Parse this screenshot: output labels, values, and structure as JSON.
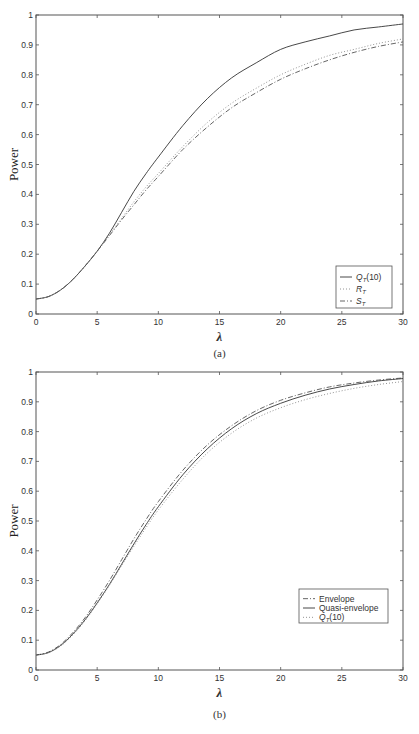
{
  "chart_data": [
    {
      "id": "a",
      "type": "line",
      "caption": "(a)",
      "xlabel": "λ",
      "ylabel": "Power",
      "xlim": [
        0,
        30
      ],
      "ylim": [
        0,
        1
      ],
      "xticks": [
        0,
        5,
        10,
        15,
        20,
        25,
        30
      ],
      "yticks": [
        0,
        0.1,
        0.2,
        0.3,
        0.4,
        0.5,
        0.6,
        0.7,
        0.8,
        0.9,
        1
      ],
      "grid": false,
      "legend_position": "lower right",
      "x": [
        0,
        1,
        2,
        3,
        4,
        5,
        6,
        7,
        8,
        9,
        10,
        12,
        14,
        16,
        18,
        20,
        22,
        24,
        26,
        28,
        30
      ],
      "series": [
        {
          "name": "Q_T(10)",
          "label_main": "Q",
          "label_sub": "T",
          "label_suffix": "(10)",
          "style": "solid",
          "values": [
            0.05,
            0.058,
            0.08,
            0.115,
            0.16,
            0.21,
            0.27,
            0.34,
            0.41,
            0.47,
            0.525,
            0.63,
            0.72,
            0.79,
            0.84,
            0.885,
            0.91,
            0.93,
            0.95,
            0.96,
            0.97
          ]
        },
        {
          "name": "R_T",
          "label_main": "R",
          "label_sub": "T",
          "label_suffix": "",
          "style": "dotted",
          "values": [
            0.05,
            0.058,
            0.08,
            0.115,
            0.16,
            0.21,
            0.265,
            0.32,
            0.375,
            0.425,
            0.47,
            0.56,
            0.64,
            0.705,
            0.755,
            0.8,
            0.835,
            0.865,
            0.885,
            0.905,
            0.92
          ]
        },
        {
          "name": "S_T",
          "label_main": "S",
          "label_sub": "T",
          "label_suffix": "",
          "style": "dashdot",
          "values": [
            0.05,
            0.058,
            0.08,
            0.115,
            0.16,
            0.21,
            0.262,
            0.315,
            0.365,
            0.415,
            0.46,
            0.55,
            0.625,
            0.69,
            0.74,
            0.785,
            0.82,
            0.85,
            0.875,
            0.895,
            0.91
          ]
        }
      ]
    },
    {
      "id": "b",
      "type": "line",
      "caption": "(b)",
      "xlabel": "λ",
      "ylabel": "Power",
      "xlim": [
        0,
        30
      ],
      "ylim": [
        0,
        1
      ],
      "xticks": [
        0,
        5,
        10,
        15,
        20,
        25,
        30
      ],
      "yticks": [
        0,
        0.1,
        0.2,
        0.3,
        0.4,
        0.5,
        0.6,
        0.7,
        0.8,
        0.9,
        1
      ],
      "grid": false,
      "legend_position": "center right",
      "x": [
        0,
        1,
        2,
        3,
        4,
        5,
        6,
        7,
        8,
        9,
        10,
        12,
        14,
        16,
        18,
        20,
        22,
        24,
        26,
        28,
        30
      ],
      "series": [
        {
          "name": "Envelope",
          "label_main": "Envelope",
          "label_sub": "",
          "label_suffix": "",
          "style": "dashdot",
          "values": [
            0.05,
            0.06,
            0.085,
            0.125,
            0.175,
            0.235,
            0.3,
            0.37,
            0.44,
            0.505,
            0.565,
            0.67,
            0.755,
            0.82,
            0.87,
            0.905,
            0.93,
            0.95,
            0.963,
            0.973,
            0.98
          ]
        },
        {
          "name": "Quasi-envelope",
          "label_main": "Quasi-envelope",
          "label_sub": "",
          "label_suffix": "",
          "style": "solid",
          "values": [
            0.05,
            0.058,
            0.082,
            0.12,
            0.168,
            0.225,
            0.287,
            0.355,
            0.423,
            0.488,
            0.548,
            0.655,
            0.742,
            0.81,
            0.86,
            0.895,
            0.922,
            0.943,
            0.958,
            0.97,
            0.978
          ]
        },
        {
          "name": "Q_T(10)",
          "label_main": "Q",
          "label_sub": "T",
          "label_suffix": "(10)",
          "style": "dotted",
          "values": [
            0.05,
            0.058,
            0.08,
            0.117,
            0.165,
            0.222,
            0.284,
            0.35,
            0.415,
            0.478,
            0.537,
            0.64,
            0.728,
            0.795,
            0.845,
            0.88,
            0.907,
            0.928,
            0.945,
            0.958,
            0.968
          ]
        }
      ]
    }
  ]
}
